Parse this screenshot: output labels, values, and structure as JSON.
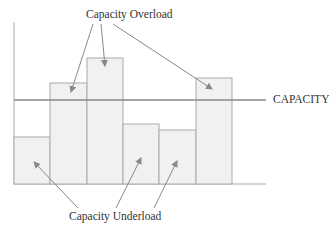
{
  "diagram": {
    "type": "capacity-load-bar-diagram",
    "labels": {
      "overload": "Capacity Overload",
      "underload": "Capacity Underload",
      "capacity": "CAPACITY"
    },
    "bars": [
      {
        "index": 1,
        "status": "underload"
      },
      {
        "index": 2,
        "status": "overload"
      },
      {
        "index": 3,
        "status": "overload"
      },
      {
        "index": 4,
        "status": "underload"
      },
      {
        "index": 5,
        "status": "underload"
      },
      {
        "index": 6,
        "status": "overload"
      }
    ],
    "colors": {
      "bar_fill": "#f0f0f0",
      "bar_stroke": "#aaaaaa",
      "line": "#888888",
      "text": "#333333"
    }
  }
}
